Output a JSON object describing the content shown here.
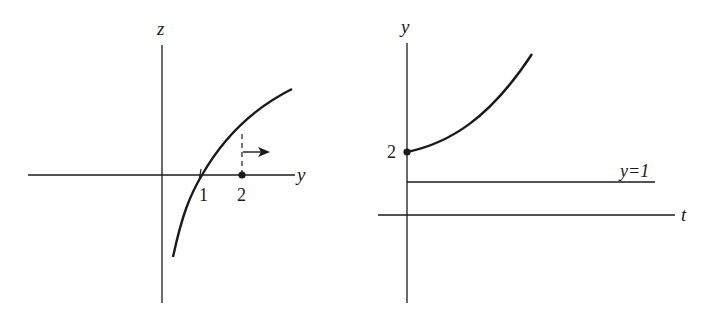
{
  "colors": {
    "ink": "#1a1a1a",
    "background": "#ffffff"
  },
  "left_plot": {
    "horizontal_axis_label": "y",
    "vertical_axis_label": "z",
    "tick_labels": [
      "1",
      "2"
    ],
    "curve": "increasing concave-down curve crossing horizontal axis at 1",
    "marked_point": "2",
    "annotation": "dashed line at y=2 with arrow pointing right"
  },
  "right_plot": {
    "horizontal_axis_label": "t",
    "vertical_axis_label": "y",
    "initial_value_label": "2",
    "equilibrium_label": "y=1",
    "curve": "solution starting at y=2 increasing away from equilibrium y=1"
  }
}
